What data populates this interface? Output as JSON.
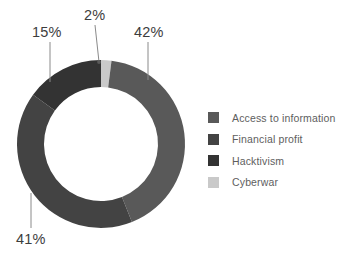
{
  "chart_data": {
    "type": "pie",
    "variant": "donut",
    "title": "",
    "subtitle": "",
    "xlabel": "",
    "ylabel": "",
    "grid": false,
    "legend_position": "right",
    "units": "percent",
    "start_angle_deg": 0,
    "direction": "clockwise",
    "inner_radius_ratio": 0.68,
    "categories": [
      "Access to information",
      "Financial profit",
      "Hacktivism",
      "Cyberwar"
    ],
    "values": [
      42,
      41,
      15,
      2
    ],
    "value_labels": [
      "42%",
      "41%",
      "15%",
      "2%"
    ],
    "colors": [
      "#595959",
      "#434343",
      "#333333",
      "#c9c9c9"
    ],
    "slices": [
      {
        "name": "Cyberwar",
        "value": 2,
        "label": "2%",
        "color": "#c9c9c9",
        "start_deg": 0,
        "end_deg": 7.2,
        "label_x": 84,
        "label_y": 8,
        "leader_from_x": 95,
        "leader_from_y": 25,
        "leader_to_x": 99,
        "leader_to_y": 62
      },
      {
        "name": "Access to information",
        "value": 42,
        "label": "42%",
        "color": "#595959",
        "start_deg": 7.2,
        "end_deg": 158.4,
        "label_x": 134,
        "label_y": 25,
        "leader_from_x": 148,
        "leader_from_y": 42,
        "leader_to_x": 148,
        "leader_to_y": 80
      },
      {
        "name": "Financial profit",
        "value": 41,
        "label": "41%",
        "color": "#434343",
        "start_deg": 158.4,
        "end_deg": 306.0,
        "label_x": 16,
        "label_y": 232,
        "leader_from_x": 31,
        "leader_from_y": 193,
        "leader_to_x": 31,
        "leader_to_y": 228
      },
      {
        "name": "Hacktivism",
        "value": 15,
        "label": "15%",
        "color": "#333333",
        "start_deg": 306.0,
        "end_deg": 360,
        "label_x": 32,
        "label_y": 25,
        "leader_from_x": 50,
        "leader_from_y": 42,
        "leader_to_x": 50,
        "leader_to_y": 82
      }
    ],
    "geometry": {
      "center_x": 101,
      "center_y": 144,
      "outer_radius": 84,
      "inner_radius": 57
    }
  },
  "labels": {
    "pct_hacktivism": "15%",
    "pct_cyberwar": "2%",
    "pct_access": "42%",
    "pct_financial": "41%"
  },
  "legend": {
    "items": [
      {
        "label": "Access to information",
        "color": "#595959"
      },
      {
        "label": "Financial profit",
        "color": "#434343"
      },
      {
        "label": "Hacktivism",
        "color": "#333333"
      },
      {
        "label": "Cyberwar",
        "color": "#c9c9c9"
      }
    ]
  }
}
